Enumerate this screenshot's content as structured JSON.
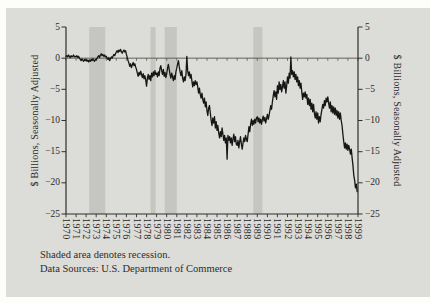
{
  "figure": {
    "left_axis_title": "$ Billions, Seasonally Adjusted",
    "right_axis_title": "$ Billions, Seasonally Adjusted",
    "footnote_line1": "Shaded area denotes recession.",
    "footnote_line2": "Data Sources: U.S. Department of Commerce"
  },
  "colors": {
    "page_bg": "#fdfdfc",
    "panel_bg": "#dcdcd8",
    "band": "#c5c5c1",
    "line": "#161616",
    "axis": "#2f2f2c",
    "zero_line": "#55544f",
    "text": "#2b2a27"
  },
  "chart_data": {
    "type": "line",
    "title": "",
    "xlabel": "",
    "ylabel": "$ Billions, Seasonally Adjusted",
    "x_range": [
      1970,
      1999
    ],
    "y_range": [
      -25,
      5
    ],
    "y_ticks": [
      5,
      0,
      -5,
      -10,
      -15,
      -20,
      -25
    ],
    "y_tick_labels": [
      "5",
      "0",
      "−5",
      "−10",
      "−15",
      "−20",
      "−25"
    ],
    "x_ticks": [
      1970,
      1971,
      1972,
      1973,
      1974,
      1975,
      1976,
      1977,
      1978,
      1979,
      1980,
      1981,
      1982,
      1983,
      1984,
      1985,
      1986,
      1987,
      1988,
      1989,
      1990,
      1991,
      1992,
      1993,
      1994,
      1995,
      1996,
      1997,
      1998,
      1999
    ],
    "grid": "horizontal zero line only",
    "legend": "none",
    "annotations": [
      "Shaded area denotes recession.",
      "Data Sources: U.S. Department of Commerce"
    ],
    "recessions": [
      [
        1972.3,
        1973.9
      ],
      [
        1978.4,
        1978.9
      ],
      [
        1979.8,
        1981.0
      ],
      [
        1988.6,
        1989.5
      ]
    ],
    "series": [
      {
        "name": "U.S. trade balance, monthly, $ billions seasonally adjusted",
        "start_year": 1970,
        "step_years": 0.083333,
        "values": [
          0.3,
          0.4,
          0.2,
          0.5,
          0.3,
          0.1,
          0.4,
          0.2,
          0.3,
          0.5,
          0.2,
          0.3,
          0.2,
          0.4,
          0.1,
          0.3,
          0.0,
          -0.2,
          -0.4,
          -0.1,
          -0.3,
          -0.5,
          -0.2,
          -0.4,
          -0.2,
          -0.5,
          -0.3,
          -0.6,
          -0.3,
          -0.5,
          -0.2,
          -0.4,
          -0.1,
          -0.3,
          -0.5,
          -0.2,
          -0.3,
          0.0,
          0.2,
          0.4,
          0.1,
          0.5,
          0.7,
          0.4,
          0.6,
          0.3,
          0.5,
          0.2,
          0.3,
          0.0,
          -0.2,
          0.1,
          -0.4,
          -0.1,
          0.2,
          0.0,
          0.3,
          0.6,
          0.4,
          0.7,
          1.0,
          1.2,
          0.9,
          1.3,
          1.1,
          1.4,
          1.0,
          0.8,
          1.1,
          1.3,
          1.0,
          1.2,
          0.6,
          0.1,
          -0.4,
          -0.8,
          -1.3,
          -0.9,
          -1.5,
          -1.1,
          -0.7,
          -1.2,
          -0.9,
          -1.4,
          -1.8,
          -2.4,
          -2.9,
          -2.3,
          -2.7,
          -2.1,
          -2.6,
          -3.1,
          -2.5,
          -3.3,
          -2.8,
          -3.5,
          -4.5,
          -3.2,
          -2.6,
          -3.4,
          -2.8,
          -3.6,
          -2.4,
          -3.0,
          -2.2,
          -2.8,
          -2.0,
          -2.6,
          -2.4,
          -3.0,
          -2.2,
          -2.8,
          -1.6,
          -1.2,
          -2.0,
          -2.6,
          -1.8,
          -2.9,
          -2.3,
          -3.1,
          -2.5,
          -1.6,
          -1.0,
          -1.8,
          -2.6,
          -3.2,
          -2.4,
          -3.0,
          -3.6,
          -2.8,
          -3.4,
          -2.2,
          -1.6,
          -0.9,
          -0.4,
          -1.4,
          -2.2,
          -2.8,
          -2.0,
          -3.2,
          -3.8,
          -3.0,
          -3.6,
          -2.6,
          0.3,
          -2.0,
          -2.8,
          -2.2,
          -3.2,
          -2.6,
          -3.6,
          -4.6,
          -3.8,
          -4.4,
          -3.6,
          -4.2,
          -3.8,
          -4.6,
          -5.6,
          -4.8,
          -5.8,
          -6.4,
          -5.6,
          -6.6,
          -7.2,
          -6.4,
          -7.8,
          -7.0,
          -8.4,
          -9.2,
          -8.0,
          -7.6,
          -8.8,
          -10.0,
          -10.8,
          -9.6,
          -10.4,
          -9.4,
          -11.2,
          -10.2,
          -11.6,
          -10.8,
          -12.0,
          -12.8,
          -11.8,
          -12.6,
          -11.2,
          -12.2,
          -13.2,
          -12.4,
          -13.6,
          -12.8,
          -16.2,
          -12.4,
          -13.2,
          -12.6,
          -13.6,
          -12.8,
          -14.0,
          -13.0,
          -12.2,
          -13.4,
          -12.6,
          -13.8,
          -14.0,
          -13.2,
          -14.4,
          -13.4,
          -12.6,
          -13.8,
          -14.6,
          -13.6,
          -12.8,
          -13.4,
          -12.4,
          -13.0,
          -13.4,
          -12.2,
          -11.0,
          -11.8,
          -10.6,
          -9.8,
          -10.8,
          -10.0,
          -10.6,
          -9.8,
          -10.4,
          -9.6,
          -9.4,
          -10.2,
          -9.6,
          -10.4,
          -9.8,
          -10.6,
          -9.9,
          -9.3,
          -10.1,
          -9.5,
          -10.4,
          -9.7,
          -9.0,
          -9.8,
          -9.2,
          -8.4,
          -7.6,
          -8.2,
          -7.0,
          -6.0,
          -5.2,
          -6.2,
          -5.4,
          -6.6,
          -4.4,
          -5.6,
          -3.8,
          -5.0,
          -4.2,
          -5.4,
          -4.6,
          -3.6,
          -4.8,
          -3.8,
          -5.6,
          -4.4,
          -3.0,
          -4.0,
          -2.4,
          -3.2,
          0.2,
          -2.6,
          -2.0,
          -3.0,
          -2.2,
          -3.4,
          -2.6,
          -3.8,
          -3.0,
          -4.4,
          -3.6,
          -4.8,
          -4.0,
          -5.4,
          -6.6,
          -5.6,
          -6.2,
          -5.4,
          -6.4,
          -5.8,
          -7.4,
          -6.4,
          -7.6,
          -6.6,
          -8.2,
          -7.2,
          -8.6,
          -7.4,
          -8.8,
          -9.6,
          -8.6,
          -9.8,
          -8.8,
          -10.4,
          -9.4,
          -10.2,
          -9.0,
          -8.2,
          -7.4,
          -8.0,
          -6.8,
          -7.6,
          -6.4,
          -7.0,
          -6.2,
          -7.2,
          -8.0,
          -7.0,
          -8.6,
          -7.6,
          -8.8,
          -7.8,
          -9.0,
          -8.0,
          -9.2,
          -8.4,
          -9.6,
          -8.6,
          -9.8,
          -8.8,
          -10.0,
          -10.8,
          -12.2,
          -13.4,
          -14.4,
          -13.6,
          -14.6,
          -13.8,
          -14.8,
          -14.0,
          -14.6,
          -15.4,
          -14.6,
          -16.0,
          -17.2,
          -18.8,
          -19.6,
          -20.8,
          -20.2,
          -21.4
        ]
      }
    ]
  }
}
